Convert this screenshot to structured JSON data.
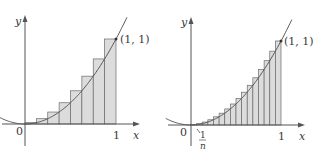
{
  "figures": [
    {
      "id": "left",
      "n": 8,
      "function": "y = x^2",
      "rule": "right endpoints",
      "point_label": "(1, 1)",
      "origin_label": "0",
      "x_tick_label": "1",
      "x_axis_label": "x",
      "y_axis_label": "y"
    },
    {
      "id": "right",
      "n": 16,
      "function": "y = x^2",
      "rule": "right endpoints",
      "point_label": "(1, 1)",
      "origin_label": "0",
      "x_tick_label": "1",
      "x_axis_label": "x",
      "y_axis_label": "y",
      "width_label_num": "1",
      "width_label_den": "n"
    }
  ],
  "colors": {
    "axis": "#555555",
    "curve": "#555555",
    "rect_fill": "#dcdcdc",
    "rect_stroke": "#6a6a6a",
    "text": "#3a3a3a"
  }
}
